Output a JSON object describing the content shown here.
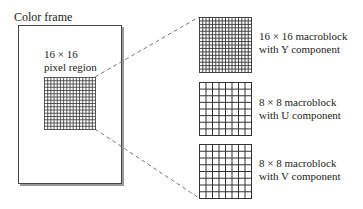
{
  "frame": {
    "title": "Color frame",
    "region_label_line1": "16 × 16",
    "region_label_line2": "pixel region",
    "region_grid_cells": 16
  },
  "blocks": [
    {
      "line1": "16 × 16 macroblock",
      "line2": "with Y component",
      "grid_cells": 16
    },
    {
      "line1": "8 × 8 macroblock",
      "line2": "with U component",
      "grid_cells": 8
    },
    {
      "line1": "8 × 8 macroblock",
      "line2": "with V component",
      "grid_cells": 8
    }
  ],
  "colors": {
    "line": "#333333",
    "frame_shadow": "#888888",
    "dash": "#777777"
  }
}
